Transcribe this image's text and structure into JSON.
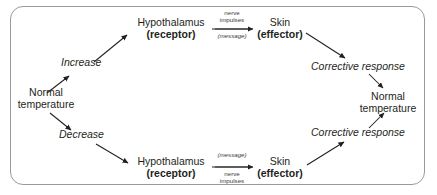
{
  "diagram": {
    "frame": {
      "border_color": "#9a9a9a",
      "background": "#ffffff",
      "rounded": true
    },
    "text_color": "#231f20",
    "nodes": {
      "start_temperature_line1": "Normal",
      "start_temperature_line2": "temperature",
      "increase": "Increase",
      "decrease": "Decrease",
      "hypothalamus_top_line1": "Hypothalamus",
      "hypothalamus_top_line2": "(receptor)",
      "hypothalamus_bottom_line1": "Hypothalamus",
      "hypothalamus_bottom_line2": "(receptor)",
      "skin_top_line1": "Skin",
      "skin_top_line2": "(effector)",
      "skin_bottom_line1": "Skin",
      "skin_bottom_line2": "(effector)",
      "corrective_response_top": "Corrective response",
      "corrective_response_bottom": "Corrective response",
      "end_temperature_line1": "Normal",
      "end_temperature_line2": "temperature"
    },
    "arrow_labels": {
      "top_above_line1": "nerve",
      "top_above_line2": "impulses",
      "top_below": "(message)",
      "bottom_above": "(message)",
      "bottom_below_line1": "nerve",
      "bottom_below_line2": "impulses"
    }
  }
}
